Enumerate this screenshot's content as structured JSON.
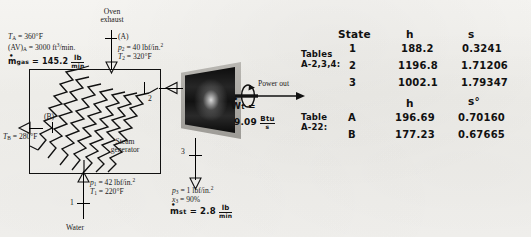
{
  "figure": {
    "stream_labels": {
      "oven_exhaust_line1": "Oven",
      "oven_exhaust_line2": "exhaust",
      "port_a": "(A)",
      "port_b": "(B)",
      "state_1": "1",
      "state_2": "2",
      "state_3": "3",
      "water": "Water",
      "device_line1": "Steam",
      "device_line2": "generator",
      "power_out": "Power out"
    },
    "printed_annotations": {
      "TA": {
        "sym": "T",
        "sub": "A",
        "eq": "= 360°F"
      },
      "AVA": {
        "sym": "(AV)",
        "sub": "A",
        "eq": "= 3000 ft",
        "sup": "3",
        "tail": "/min."
      },
      "p2": {
        "sym": "p",
        "sub": "2",
        "eq": "= 40 lbf/in.",
        "sup": "2"
      },
      "T2": {
        "sym": "T",
        "sub": "2",
        "eq": "= 320°F"
      },
      "TB": {
        "sym": "T",
        "sub": "B",
        "eq": "= 280°F"
      },
      "p1": {
        "sym": "p",
        "sub": "1",
        "eq": "= 42 lbf/in.",
        "sup": "2"
      },
      "T1": {
        "sym": "T",
        "sub": "1",
        "eq": "= 220°F"
      },
      "p3": {
        "sym": "p",
        "sub": "3",
        "eq": "= 1 lbf/in.",
        "sup": "2"
      },
      "x3": {
        "sym": "x",
        "sub": "3",
        "eq": "= 90%"
      }
    },
    "handwritten_annotations": {
      "m_gas": {
        "sym": "m",
        "sub": "gas",
        "eq": "= 145.2",
        "num": "lb",
        "den": "min"
      },
      "W_t": {
        "sym": "W",
        "sub": "t",
        "eq": "=",
        "value": "9.09",
        "num": "Btu",
        "den": "s"
      },
      "m_st": {
        "sym": "m",
        "sub": "st",
        "eq": "= 2.8",
        "num": "lb",
        "den": "min"
      }
    }
  },
  "table_upper": {
    "source_line1": "Tables",
    "source_line2": "A-2,3,4:",
    "headers": [
      "State",
      "h",
      "s"
    ],
    "rows": [
      {
        "state": "1",
        "h": "188.2",
        "s": "0.3241"
      },
      {
        "state": "2",
        "h": "1196.8",
        "s": "1.71206"
      },
      {
        "state": "3",
        "h": "1002.1",
        "s": "1.79347"
      }
    ]
  },
  "table_lower": {
    "source_line1": "Table",
    "source_line2": "A-22:",
    "headers": [
      "",
      "h",
      "s°"
    ],
    "rows": [
      {
        "state": "A",
        "h": "196.69",
        "s": "0.70160"
      },
      {
        "state": "B",
        "h": "177.23",
        "s": "0.67665"
      }
    ]
  },
  "colors": {
    "ink": "#111111",
    "paper": "#f2f1ee",
    "turbine_shell": "#aaa8a3"
  }
}
